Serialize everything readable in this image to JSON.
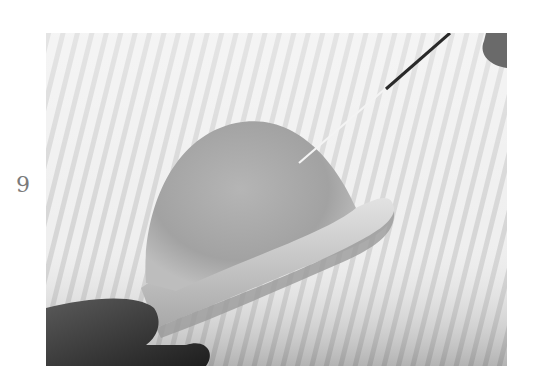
{
  "step": {
    "number": "9"
  },
  "photo": {
    "subject": "needle-felted wool bowler hat held between fingers while being poked with a felting needle",
    "palette": {
      "background": "#ececec",
      "stripe": "#d4d4d4",
      "felt_crown": "#a9a9a9",
      "felt_brim": "#cfcfcf",
      "fingers": "#3a3a3a",
      "needle": "#2a2a2a"
    }
  }
}
